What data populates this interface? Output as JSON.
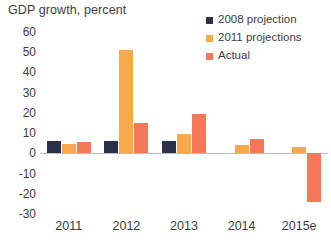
{
  "chart_data": {
    "type": "bar",
    "title": "GDP growth, percent",
    "xlabel": "",
    "ylabel": "",
    "categories": [
      "2011",
      "2012",
      "2013",
      "2014",
      "2015e"
    ],
    "ylim": [
      -30,
      60
    ],
    "yticks": [
      60,
      50,
      40,
      30,
      20,
      10,
      0,
      -10,
      -20,
      -30
    ],
    "ytick_labels": [
      "60",
      "50",
      "40",
      "30",
      "20",
      "10",
      "0",
      "-10",
      "-20",
      "-30"
    ],
    "grid": false,
    "legend_position": "top-right",
    "series": [
      {
        "name": "2008 projection",
        "color": "#2c3049",
        "values": [
          6,
          6,
          6,
          null,
          null
        ]
      },
      {
        "name": "2011 projections",
        "color": "#f9a94a",
        "values": [
          4.5,
          51,
          9.5,
          4,
          3
        ]
      },
      {
        "name": "Actual",
        "color": "#f4795b",
        "values": [
          5.5,
          15,
          19.5,
          7,
          -24
        ]
      }
    ]
  },
  "legend": {
    "items": [
      {
        "label": "2008 projection",
        "color": "#2c3049",
        "icon": "square-swatch-icon"
      },
      {
        "label": "2011 projections",
        "color": "#f9a94a",
        "icon": "square-swatch-icon"
      },
      {
        "label": "Actual",
        "color": "#f4795b",
        "icon": "square-swatch-icon"
      }
    ]
  },
  "axis": {
    "zero_line_color": "#b9bcd0"
  }
}
